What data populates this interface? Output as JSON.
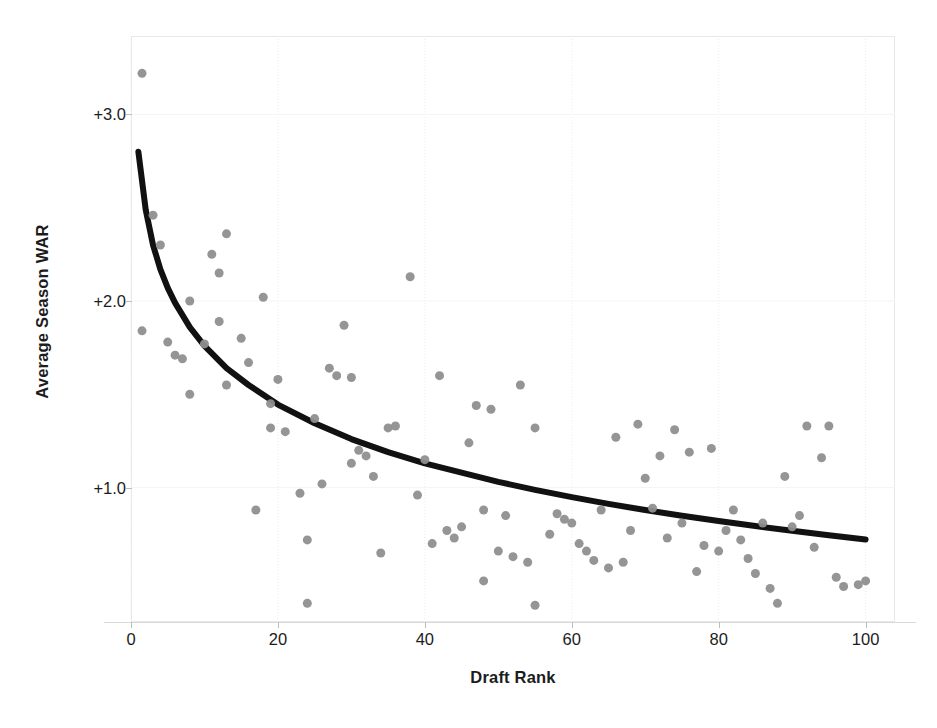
{
  "chart_data": {
    "type": "scatter",
    "title": "",
    "xlabel": "Draft Rank",
    "ylabel": "Average Season WAR",
    "xlim": [
      0,
      104
    ],
    "ylim": [
      0.28,
      3.42
    ],
    "xticks": [
      0,
      20,
      40,
      60,
      80,
      100
    ],
    "xtick_labels": [
      "0",
      "20",
      "40",
      "60",
      "80",
      "100"
    ],
    "yticks": [
      1.0,
      2.0,
      3.0
    ],
    "ytick_labels": [
      "+1.0",
      "+2.0",
      "+3.0"
    ],
    "grid": true,
    "grid_axis": "x",
    "legend": "none",
    "marker_color": "#8f8f8f",
    "marker_size": 9,
    "trendline": {
      "name": "Logarithmic fit",
      "color": "#111111",
      "width": 6,
      "formula": "y = 2.80 - 0.452 * ln(x)",
      "x_start": 1,
      "x_end": 100,
      "points": [
        [
          1,
          2.8
        ],
        [
          2,
          2.49
        ],
        [
          3,
          2.3
        ],
        [
          4,
          2.17
        ],
        [
          5,
          2.07
        ],
        [
          6,
          1.99
        ],
        [
          8,
          1.86
        ],
        [
          10,
          1.76
        ],
        [
          13,
          1.64
        ],
        [
          16,
          1.55
        ],
        [
          20,
          1.445
        ],
        [
          25,
          1.345
        ],
        [
          30,
          1.26
        ],
        [
          35,
          1.19
        ],
        [
          40,
          1.13
        ],
        [
          45,
          1.08
        ],
        [
          50,
          1.031
        ],
        [
          55,
          0.988
        ],
        [
          60,
          0.949
        ],
        [
          65,
          0.913
        ],
        [
          70,
          0.88
        ],
        [
          75,
          0.849
        ],
        [
          80,
          0.821
        ],
        [
          85,
          0.794
        ],
        [
          90,
          0.769
        ],
        [
          95,
          0.745
        ],
        [
          100,
          0.722
        ]
      ]
    },
    "points": [
      [
        1.5,
        3.22
      ],
      [
        1.5,
        1.84
      ],
      [
        3,
        2.46
      ],
      [
        4,
        2.3
      ],
      [
        5,
        1.78
      ],
      [
        6,
        1.71
      ],
      [
        7,
        1.69
      ],
      [
        8,
        2.0
      ],
      [
        8,
        1.5
      ],
      [
        10,
        1.77
      ],
      [
        11,
        2.25
      ],
      [
        12,
        2.15
      ],
      [
        12,
        1.89
      ],
      [
        13,
        2.36
      ],
      [
        13,
        1.55
      ],
      [
        15,
        1.8
      ],
      [
        16,
        1.67
      ],
      [
        17,
        0.88
      ],
      [
        18,
        2.02
      ],
      [
        19,
        1.45
      ],
      [
        19,
        1.32
      ],
      [
        20,
        1.58
      ],
      [
        21,
        1.3
      ],
      [
        23,
        0.97
      ],
      [
        24,
        0.72
      ],
      [
        24,
        0.38
      ],
      [
        25,
        1.37
      ],
      [
        26,
        1.02
      ],
      [
        27,
        1.64
      ],
      [
        28,
        1.6
      ],
      [
        29,
        1.87
      ],
      [
        30,
        1.59
      ],
      [
        30,
        1.13
      ],
      [
        31,
        1.2
      ],
      [
        32,
        1.17
      ],
      [
        33,
        1.06
      ],
      [
        34,
        0.65
      ],
      [
        35,
        1.32
      ],
      [
        36,
        1.33
      ],
      [
        38,
        2.13
      ],
      [
        39,
        0.96
      ],
      [
        40,
        1.15
      ],
      [
        41,
        0.7
      ],
      [
        42,
        1.6
      ],
      [
        43,
        0.77
      ],
      [
        44,
        0.73
      ],
      [
        45,
        0.79
      ],
      [
        46,
        1.24
      ],
      [
        47,
        1.44
      ],
      [
        48,
        0.88
      ],
      [
        48,
        0.5
      ],
      [
        49,
        1.42
      ],
      [
        50,
        0.66
      ],
      [
        51,
        0.85
      ],
      [
        52,
        0.63
      ],
      [
        53,
        1.55
      ],
      [
        54,
        0.6
      ],
      [
        55,
        0.37
      ],
      [
        55,
        1.32
      ],
      [
        57,
        0.75
      ],
      [
        58,
        0.86
      ],
      [
        59,
        0.83
      ],
      [
        60,
        0.81
      ],
      [
        61,
        0.7
      ],
      [
        62,
        0.66
      ],
      [
        63,
        0.61
      ],
      [
        64,
        0.88
      ],
      [
        65,
        0.57
      ],
      [
        66,
        1.27
      ],
      [
        67,
        0.6
      ],
      [
        68,
        0.77
      ],
      [
        69,
        1.34
      ],
      [
        70,
        1.05
      ],
      [
        71,
        0.89
      ],
      [
        72,
        1.17
      ],
      [
        73,
        0.73
      ],
      [
        74,
        1.31
      ],
      [
        75,
        0.81
      ],
      [
        76,
        1.19
      ],
      [
        77,
        0.55
      ],
      [
        78,
        0.69
      ],
      [
        79,
        1.21
      ],
      [
        80,
        0.66
      ],
      [
        81,
        0.77
      ],
      [
        82,
        0.88
      ],
      [
        83,
        0.72
      ],
      [
        84,
        0.62
      ],
      [
        85,
        0.54
      ],
      [
        86,
        0.81
      ],
      [
        87,
        0.46
      ],
      [
        88,
        0.38
      ],
      [
        89,
        1.06
      ],
      [
        90,
        0.79
      ],
      [
        91,
        0.85
      ],
      [
        92,
        1.33
      ],
      [
        93,
        0.68
      ],
      [
        94,
        1.16
      ],
      [
        95,
        1.33
      ],
      [
        96,
        0.52
      ],
      [
        97,
        0.47
      ],
      [
        99,
        0.48
      ],
      [
        100,
        0.5
      ]
    ]
  }
}
